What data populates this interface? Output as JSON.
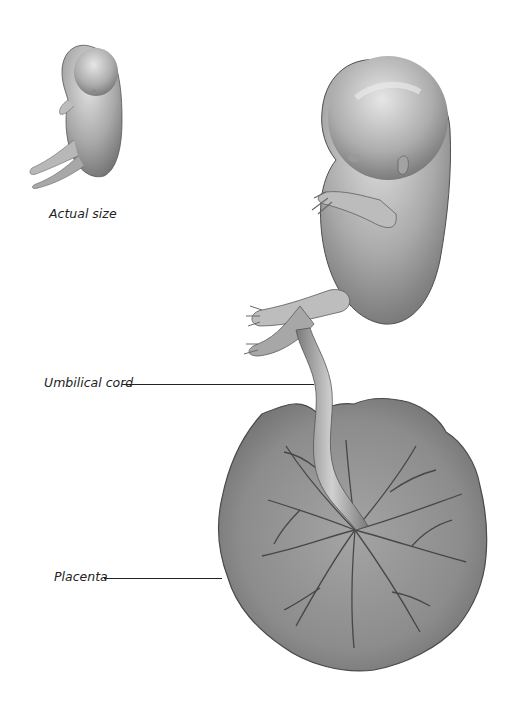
{
  "diagram": {
    "labels": {
      "actual_size": "Actual size",
      "umbilical_cord": "Umbilical cord",
      "placenta": "Placenta"
    },
    "colors": {
      "background": "#ffffff",
      "skin_light": "#d6d6d6",
      "skin_mid": "#a8a8a8",
      "skin_dark": "#6e6e6e",
      "placenta_base": "#8a8a8a",
      "vessel": "#3a3a3a",
      "leader_line": "#222222"
    }
  }
}
